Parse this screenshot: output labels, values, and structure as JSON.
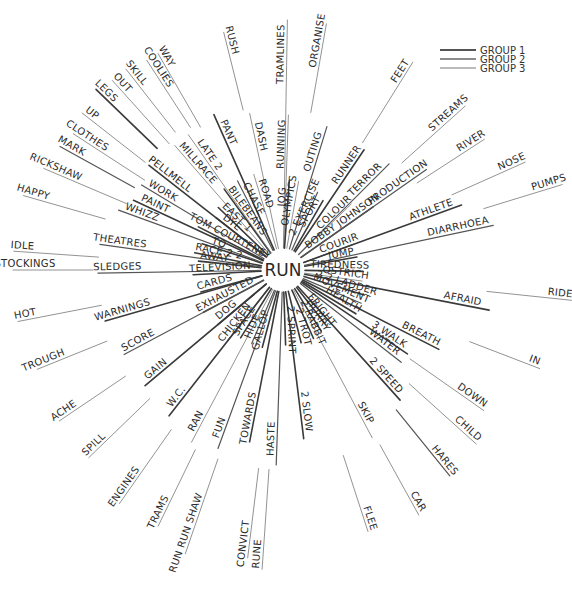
{
  "diagram": {
    "center": {
      "label": "RUN",
      "x": 283,
      "y": 270
    },
    "legend": [
      {
        "label": "GROUP 1",
        "weight": 2.0
      },
      {
        "label": "GROUP 2",
        "weight": 1.5
      },
      {
        "label": "GROUP 3",
        "weight": 1.0
      }
    ],
    "spokes": [
      {
        "word": "TRAMLINES",
        "angle": -89,
        "inner": 22,
        "outer": 250,
        "group": 3,
        "label_at": 0.85
      },
      {
        "word": "RUNNING",
        "angle": -88,
        "inner": 22,
        "outer": 155,
        "group": 3,
        "label_at": 0.78
      },
      {
        "word": "ORGANISE",
        "angle": -80,
        "inner": 160,
        "outer": 250,
        "group": 3,
        "label_at": 0.8
      },
      {
        "word": "OUTING",
        "angle": -73,
        "inner": 22,
        "outer": 150,
        "group": 2,
        "label_at": 0.78
      },
      {
        "word": "JOG",
        "angle": -86,
        "inner": 22,
        "outer": 90,
        "group": 1,
        "label_at": 0.75
      },
      {
        "word": "OLYMPICS",
        "angle": -80,
        "inner": 22,
        "outer": 90,
        "group": 3,
        "label_at": 0.7
      },
      {
        "word": "2 EXERCISE",
        "angle": -66,
        "inner": 22,
        "outer": 85,
        "group": 2,
        "label_at": 0.7
      },
      {
        "word": "SPORT",
        "angle": -60,
        "inner": 22,
        "outer": 80,
        "group": 1,
        "label_at": 0.72
      },
      {
        "word": "RUNNER",
        "angle": -56,
        "inner": 22,
        "outer": 145,
        "group": 1,
        "label_at": 0.82
      },
      {
        "word": "FEET",
        "angle": -58,
        "inner": 150,
        "outer": 245,
        "group": 3,
        "label_at": 0.85
      },
      {
        "word": "COLOUR",
        "angle": -44,
        "inner": 22,
        "outer": 95,
        "group": 3,
        "label_at": 0.75
      },
      {
        "word": "TERROR",
        "angle": -45,
        "inner": 22,
        "outer": 150,
        "group": 2,
        "label_at": 0.78
      },
      {
        "word": "STREAMS",
        "angle": -42,
        "inner": 160,
        "outer": 245,
        "group": 3,
        "label_at": 0.8
      },
      {
        "word": "BOBBY JOHNSON",
        "angle": -35,
        "inner": 22,
        "outer": 110,
        "group": 1,
        "label_at": 0.62
      },
      {
        "word": "PRODUCTION",
        "angle": -35,
        "inner": 22,
        "outer": 175,
        "group": 2,
        "label_at": 0.8
      },
      {
        "word": "RIVER",
        "angle": -33,
        "inner": 160,
        "outer": 240,
        "group": 3,
        "label_at": 0.85
      },
      {
        "word": "COURIR",
        "angle": -20,
        "inner": 22,
        "outer": 75,
        "group": 2,
        "label_at": 0.75
      },
      {
        "word": "ATHLETE",
        "angle": -20,
        "inner": 22,
        "outer": 190,
        "group": 1,
        "label_at": 0.82
      },
      {
        "word": "NOSE",
        "angle": -24,
        "inner": 185,
        "outer": 265,
        "group": 3,
        "label_at": 0.85
      },
      {
        "word": "JUMP",
        "angle": -10,
        "inner": 22,
        "outer": 75,
        "group": 1,
        "label_at": 0.72
      },
      {
        "word": "DIARRHOEA",
        "angle": -12,
        "inner": 22,
        "outer": 215,
        "group": 2,
        "label_at": 0.82
      },
      {
        "word": "PUMPS",
        "angle": -17,
        "inner": 210,
        "outer": 292,
        "group": 3,
        "label_at": 0.85
      },
      {
        "word": "TIREDNESS",
        "angle": 1,
        "inner": 22,
        "outer": 80,
        "group": 1,
        "label_at": 0.6
      },
      {
        "word": "RIDE",
        "angle": 6,
        "inner": 205,
        "outer": 290,
        "group": 3,
        "label_at": 0.86
      },
      {
        "word": "OSTRICH",
        "angle": 8,
        "inner": 22,
        "outer": 80,
        "group": 3,
        "label_at": 0.7
      },
      {
        "word": "AFRAID",
        "angle": 11,
        "inner": 22,
        "outer": 210,
        "group": 1,
        "label_at": 0.85
      },
      {
        "word": "2 2 LADDER",
        "angle": 17,
        "inner": 22,
        "outer": 85,
        "group": 1,
        "label_at": 0.68
      },
      {
        "word": "MOVEMENT",
        "angle": 23,
        "inner": 22,
        "outer": 85,
        "group": 2,
        "label_at": 0.62
      },
      {
        "word": "BREATH",
        "angle": 27,
        "inner": 22,
        "outer": 175,
        "group": 1,
        "label_at": 0.85
      },
      {
        "word": "IN",
        "angle": 21,
        "inner": 200,
        "outer": 275,
        "group": 3,
        "label_at": 0.9
      },
      {
        "word": "HEALTH",
        "angle": 31,
        "inner": 22,
        "outer": 85,
        "group": 1,
        "label_at": 0.72
      },
      {
        "word": "3 WALK",
        "angle": 34,
        "inner": 22,
        "outer": 150,
        "group": 1,
        "label_at": 0.8
      },
      {
        "word": "WATER",
        "angle": 38,
        "inner": 22,
        "outer": 150,
        "group": 2,
        "label_at": 0.8
      },
      {
        "word": "DOWN",
        "angle": 35,
        "inner": 155,
        "outer": 245,
        "group": 3,
        "label_at": 0.8
      },
      {
        "word": "FRIGHT",
        "angle": 52,
        "inner": 22,
        "outer": 70,
        "group": 1,
        "label_at": 0.7
      },
      {
        "word": "HURRY",
        "angle": 58,
        "inner": 22,
        "outer": 72,
        "group": 1,
        "label_at": 0.7
      },
      {
        "word": "2 SPEED",
        "angle": 48,
        "inner": 22,
        "outer": 175,
        "group": 1,
        "label_at": 0.82
      },
      {
        "word": "CHILD",
        "angle": 42,
        "inner": 170,
        "outer": 260,
        "group": 3,
        "label_at": 0.82
      },
      {
        "word": "HARES",
        "angle": 51,
        "inner": 180,
        "outer": 265,
        "group": 2,
        "label_at": 0.82
      },
      {
        "word": "2 RABBIT",
        "angle": 66,
        "inner": 22,
        "outer": 75,
        "group": 1,
        "label_at": 0.72
      },
      {
        "word": "SKIP",
        "angle": 62,
        "inner": 22,
        "outer": 190,
        "group": 3,
        "label_at": 0.85
      },
      {
        "word": "CAR",
        "angle": 61,
        "inner": 200,
        "outer": 280,
        "group": 3,
        "label_at": 0.85
      },
      {
        "word": "2 TROT",
        "angle": 76,
        "inner": 22,
        "outer": 75,
        "group": 1,
        "label_at": 0.72
      },
      {
        "word": "2 SLOW",
        "angle": 83,
        "inner": 22,
        "outer": 170,
        "group": 1,
        "label_at": 0.82
      },
      {
        "word": "FLEE",
        "angle": 72,
        "inner": 195,
        "outer": 275,
        "group": 3,
        "label_at": 0.85
      },
      {
        "word": "2 SPRINT",
        "angle": 88,
        "inner": 22,
        "outer": 75,
        "group": 1,
        "label_at": 0.72
      },
      {
        "word": "HASTE",
        "angle": 92,
        "inner": 22,
        "outer": 195,
        "group": 2,
        "label_at": 0.85
      },
      {
        "word": "RUNE",
        "angle": 94,
        "inner": 200,
        "outer": 300,
        "group": 3,
        "label_at": 0.85
      },
      {
        "word": "GALLOP",
        "angle": 105,
        "inner": 22,
        "outer": 80,
        "group": 1,
        "label_at": 0.72
      },
      {
        "word": "TOWARDS",
        "angle": 101,
        "inner": 22,
        "outer": 175,
        "group": 1,
        "label_at": 0.85
      },
      {
        "word": "CONVICT",
        "angle": 97,
        "inner": 200,
        "outer": 290,
        "group": 3,
        "label_at": 0.85
      },
      {
        "word": "HIDE",
        "angle": 113,
        "inner": 22,
        "outer": 80,
        "group": 2,
        "label_at": 0.72
      },
      {
        "word": "FUN",
        "angle": 110,
        "inner": 22,
        "outer": 190,
        "group": 2,
        "label_at": 0.88
      },
      {
        "word": "RUN RUN SHAW",
        "angle": 109,
        "inner": 200,
        "outer": 300,
        "group": 3,
        "label_at": 0.8
      },
      {
        "word": "SPACE",
        "angle": 122,
        "inner": 22,
        "outer": 80,
        "group": 1,
        "label_at": 0.72
      },
      {
        "word": "CHICKEN",
        "angle": 128,
        "inner": 22,
        "outer": 90,
        "group": 2,
        "label_at": 0.72
      },
      {
        "word": "RAN",
        "angle": 118,
        "inner": 22,
        "outer": 195,
        "group": 3,
        "label_at": 0.88
      },
      {
        "word": "TRAMS",
        "angle": 116,
        "inner": 200,
        "outer": 285,
        "group": 3,
        "label_at": 0.85
      },
      {
        "word": "DOG",
        "angle": 140,
        "inner": 22,
        "outer": 85,
        "group": 1,
        "label_at": 0.75
      },
      {
        "word": "W.C.",
        "angle": 128,
        "inner": 22,
        "outer": 185,
        "group": 1,
        "label_at": 0.88
      },
      {
        "word": "ENGINES",
        "angle": 125,
        "inner": 195,
        "outer": 285,
        "group": 3,
        "label_at": 0.82
      },
      {
        "word": "EXHAUSTED",
        "angle": 152,
        "inner": 22,
        "outer": 90,
        "group": 1,
        "label_at": 0.6
      },
      {
        "word": "GAIN",
        "angle": 140,
        "inner": 22,
        "outer": 180,
        "group": 1,
        "label_at": 0.88
      },
      {
        "word": "SPILL",
        "angle": 136,
        "inner": 185,
        "outer": 270,
        "group": 3,
        "label_at": 0.85
      },
      {
        "word": "SCORE",
        "angle": 152,
        "inner": 22,
        "outer": 180,
        "group": 2,
        "label_at": 0.88
      },
      {
        "word": "ACHE",
        "angle": 146,
        "inner": 190,
        "outer": 270,
        "group": 3,
        "label_at": 0.88
      },
      {
        "word": "CARDS",
        "angle": 165,
        "inner": 22,
        "outer": 85,
        "group": 1,
        "label_at": 0.75
      },
      {
        "word": "WARNINGS",
        "angle": 164,
        "inner": 22,
        "outer": 185,
        "group": 1,
        "label_at": 0.88
      },
      {
        "word": "TROUGH",
        "angle": 158,
        "inner": 190,
        "outer": 265,
        "group": 3,
        "label_at": 0.88
      },
      {
        "word": "HOT",
        "angle": 169,
        "inner": 185,
        "outer": 270,
        "group": 3,
        "label_at": 0.9
      },
      {
        "word": "TELEVISION",
        "angle": 177,
        "inner": 22,
        "outer": 90,
        "group": 1,
        "label_at": 0.6
      },
      {
        "word": "SLEDGES",
        "angle": 179,
        "inner": 22,
        "outer": 185,
        "group": 2,
        "label_at": 0.88
      },
      {
        "word": "STOCKINGS",
        "angle": 180,
        "inner": 190,
        "outer": 270,
        "group": 3,
        "label_at": 0.85
      },
      {
        "word": "IDLE",
        "angle": 184,
        "inner": 185,
        "outer": 270,
        "group": 3,
        "label_at": 0.9
      },
      {
        "word": "AWAY",
        "angle": 186,
        "inner": 22,
        "outer": 85,
        "group": 1,
        "label_at": 0.75
      },
      {
        "word": "RACE 2 2",
        "angle": 191,
        "inner": 22,
        "outer": 90,
        "group": 1,
        "label_at": 0.65
      },
      {
        "word": "THEATRES",
        "angle": 188,
        "inner": 22,
        "outer": 185,
        "group": 2,
        "label_at": 0.88
      },
      {
        "word": "TO",
        "angle": 198,
        "inner": 22,
        "outer": 85,
        "group": 1,
        "label_at": 0.75
      },
      {
        "word": "HAPPY",
        "angle": 196,
        "inner": 185,
        "outer": 270,
        "group": 3,
        "label_at": 0.9
      },
      {
        "word": "WHIZZ",
        "angle": 200,
        "inner": 22,
        "outer": 175,
        "group": 2,
        "label_at": 0.85
      },
      {
        "word": "TOM COURTENEY",
        "angle": 207,
        "inner": 22,
        "outer": 95,
        "group": 1,
        "label_at": 0.55
      },
      {
        "word": "PAINT",
        "angle": 205,
        "inner": 22,
        "outer": 165,
        "group": 1,
        "label_at": 0.85
      },
      {
        "word": "RICKSHAW",
        "angle": 203,
        "inner": 170,
        "outer": 260,
        "group": 3,
        "label_at": 0.88
      },
      {
        "word": "DYE",
        "angle": 218,
        "inner": 22,
        "outer": 85,
        "group": 1,
        "label_at": 0.75
      },
      {
        "word": "WORK",
        "angle": 211,
        "inner": 22,
        "outer": 165,
        "group": 2,
        "label_at": 0.85
      },
      {
        "word": "MARK",
        "angle": 209,
        "inner": 170,
        "outer": 255,
        "group": 2,
        "label_at": 0.88
      },
      {
        "word": "CLOTHES",
        "angle": 213,
        "inner": 165,
        "outer": 250,
        "group": 3,
        "label_at": 0.85
      },
      {
        "word": "EAST 1",
        "angle": 224,
        "inner": 22,
        "outer": 90,
        "group": 1,
        "label_at": 0.7
      },
      {
        "word": "PELLMELL",
        "angle": 218,
        "inner": 22,
        "outer": 170,
        "group": 1,
        "label_at": 0.85
      },
      {
        "word": "UP",
        "angle": 218,
        "inner": 175,
        "outer": 255,
        "group": 3,
        "label_at": 0.9
      },
      {
        "word": "LEGS",
        "angle": 224,
        "inner": 175,
        "outer": 260,
        "group": 1,
        "label_at": 0.9
      },
      {
        "word": "BILEBEANS",
        "angle": 234,
        "inner": 22,
        "outer": 100,
        "group": 1,
        "label_at": 0.6
      },
      {
        "word": "MILLRACE",
        "angle": 229,
        "inner": 22,
        "outer": 165,
        "group": 3,
        "label_at": 0.8
      },
      {
        "word": "OUT",
        "angle": 228,
        "inner": 170,
        "outer": 255,
        "group": 3,
        "label_at": 0.9
      },
      {
        "word": "SKILL",
        "angle": 232,
        "inner": 175,
        "outer": 255,
        "group": 3,
        "label_at": 0.88
      },
      {
        "word": "CHASE",
        "angle": 243,
        "inner": 22,
        "outer": 100,
        "group": 2,
        "label_at": 0.7
      },
      {
        "word": "LATE 2",
        "angle": 235,
        "inner": 22,
        "outer": 165,
        "group": 3,
        "label_at": 0.8
      },
      {
        "word": "COOLIES",
        "angle": 237,
        "inner": 170,
        "outer": 250,
        "group": 3,
        "label_at": 0.85
      },
      {
        "word": "WAY",
        "angle": 240,
        "inner": 165,
        "outer": 250,
        "group": 3,
        "label_at": 0.92
      },
      {
        "word": "ROAD",
        "angle": 253,
        "inner": 22,
        "outer": 100,
        "group": 3,
        "label_at": 0.72
      },
      {
        "word": "PANT",
        "angle": 246,
        "inner": 22,
        "outer": 170,
        "group": 1,
        "label_at": 0.85
      },
      {
        "word": "DASH",
        "angle": 258,
        "inner": 22,
        "outer": 160,
        "group": 3,
        "label_at": 0.82
      },
      {
        "word": "RUSH",
        "angle": 256,
        "inner": 165,
        "outer": 245,
        "group": 3,
        "label_at": 0.88
      }
    ]
  }
}
